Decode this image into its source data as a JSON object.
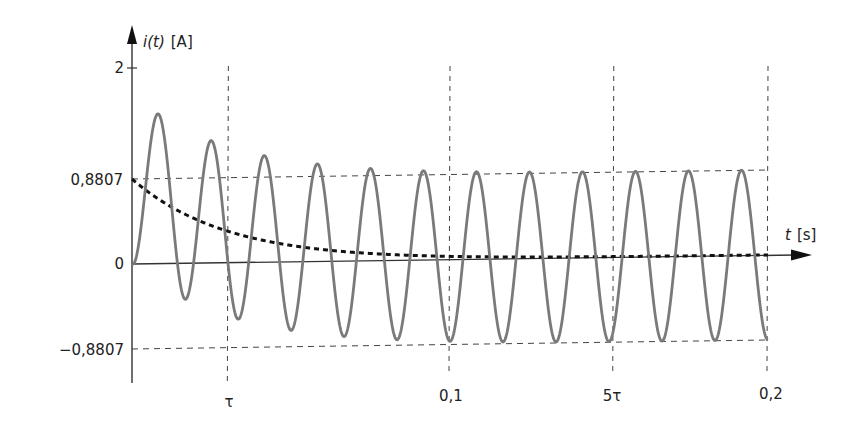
{
  "chart_data": {
    "type": "line",
    "title": "",
    "xlabel": "t [s]",
    "ylabel": "i(t) [A]",
    "xlabel_var": "t",
    "xlabel_unit": "[s]",
    "ylabel_var": "i(t)",
    "ylabel_unit": "[A]",
    "xlim": [
      0,
      0.2
    ],
    "ylim": [
      -0.8807,
      2
    ],
    "grid": false,
    "legend": null,
    "y_ticks": [
      {
        "value": 2,
        "label": "2"
      },
      {
        "value": 0.8807,
        "label": "0,8807"
      },
      {
        "value": 0,
        "label": "0"
      },
      {
        "value": -0.8807,
        "label": "−0,8807"
      }
    ],
    "x_ticks": [
      {
        "value": 0.0303,
        "label": "τ"
      },
      {
        "value": 0.1,
        "label": "0,1"
      },
      {
        "value": 0.1515,
        "label": "5τ"
      },
      {
        "value": 0.2,
        "label": "0,2"
      }
    ],
    "reference_lines": {
      "horizontal": [
        0.8807,
        -0.8807
      ],
      "vertical": [
        0.0303,
        0.1,
        0.1515,
        0.2
      ]
    },
    "parameters": {
      "amplitude": 0.8807,
      "tau": 0.0303,
      "frequency_hz": 60
    },
    "series": [
      {
        "name": "i(t)",
        "style": "solid",
        "color": "#7a7a7a",
        "formula": "0.8807*(exp(-t/tau) - cos(2*pi*60*t))",
        "x": [
          0,
          0.00833,
          0.01667,
          0.025,
          0.03333,
          0.04167,
          0.05,
          0.05833,
          0.06667,
          0.075,
          0.08333,
          0.09167,
          0.1,
          0.10833,
          0.11667,
          0.125,
          0.13333,
          0.14167,
          0.15,
          0.15833,
          0.16667,
          0.175,
          0.18333,
          0.19167,
          0.2
        ],
        "values": [
          0,
          1.55,
          -0.51,
          1.31,
          -0.58,
          1.16,
          -0.68,
          1.04,
          -0.74,
          0.97,
          -0.79,
          0.93,
          -0.83,
          0.91,
          -0.85,
          0.89,
          -0.86,
          0.89,
          -0.87,
          0.88,
          -0.87,
          0.88,
          -0.88,
          0.88,
          -0.88
        ]
      },
      {
        "name": "exponential component",
        "style": "dashed",
        "color": "#111111",
        "formula": "0.8807*exp(-t/tau)",
        "x": [
          0,
          0.0303,
          0.0606,
          0.0909,
          0.1212,
          0.1515,
          0.2
        ],
        "values": [
          0.8807,
          0.324,
          0.119,
          0.044,
          0.016,
          0.006,
          0.001
        ]
      }
    ]
  }
}
